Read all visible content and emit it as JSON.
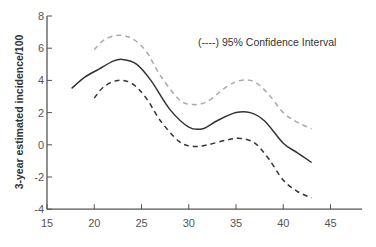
{
  "chart_data": {
    "type": "line",
    "title": "",
    "xlabel": "",
    "ylabel": "3-year estimated incidence/100",
    "xlim": [
      15,
      48
    ],
    "ylim": [
      -4,
      8
    ],
    "x_ticks": [
      15,
      20,
      25,
      30,
      35,
      40,
      45
    ],
    "y_ticks": [
      8,
      6,
      4,
      2,
      0,
      -2,
      -4
    ],
    "x_tick_labels": [
      "15",
      "20",
      "25",
      "30",
      "35",
      "40",
      "45"
    ],
    "y_tick_labels": [
      "8",
      "6",
      "4",
      "2",
      "0",
      "-2",
      "-4"
    ],
    "grid": false,
    "legend": {
      "position": "upper right",
      "text": "(----) 95% Confidence Interval"
    },
    "series": [
      {
        "name": "Estimate",
        "style": "solid",
        "color": "#333333",
        "x": [
          17.6,
          19,
          20.5,
          22,
          23,
          24.5,
          26,
          28,
          30,
          31.5,
          33,
          35,
          36.5,
          38,
          40,
          41.5,
          43
        ],
        "y": [
          3.5,
          4.2,
          4.7,
          5.2,
          5.3,
          5.0,
          4.0,
          2.2,
          1.1,
          1.0,
          1.5,
          2.0,
          2.0,
          1.5,
          0.1,
          -0.5,
          -1.1
        ]
      },
      {
        "name": "Upper 95% CI",
        "style": "dashed",
        "color": "#aaaaaa",
        "x": [
          20,
          21,
          22.5,
          24,
          25.5,
          27,
          29,
          30.5,
          32,
          34,
          35.5,
          37,
          38.5,
          40,
          41.5,
          43
        ],
        "y": [
          5.9,
          6.5,
          6.8,
          6.6,
          5.8,
          4.3,
          2.8,
          2.5,
          2.7,
          3.6,
          4.0,
          3.9,
          3.1,
          2.0,
          1.4,
          1.0
        ]
      },
      {
        "name": "Lower 95% CI",
        "style": "dashed",
        "color": "#333333",
        "x": [
          20,
          21,
          22.5,
          24,
          25.5,
          27,
          29,
          30.5,
          32,
          34,
          35.5,
          37,
          38.5,
          40,
          41.5,
          43
        ],
        "y": [
          2.9,
          3.6,
          4.0,
          3.8,
          2.9,
          1.5,
          0.2,
          -0.1,
          0.0,
          0.3,
          0.4,
          0.1,
          -0.9,
          -2.2,
          -2.9,
          -3.3
        ]
      }
    ]
  }
}
